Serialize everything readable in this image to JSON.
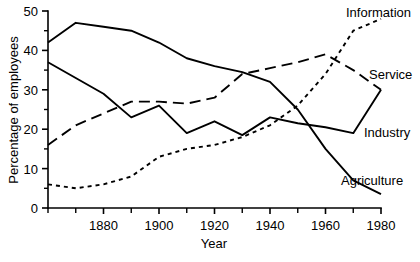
{
  "chart_data": {
    "type": "line",
    "title": "",
    "xlabel": "Year",
    "ylabel": "Percentage of employees",
    "xlim": [
      1860,
      1980
    ],
    "ylim": [
      0,
      50
    ],
    "grid": false,
    "legend_position": "inline-right-of-line-ends",
    "x_ticks": [
      1880,
      1900,
      1920,
      1940,
      1960,
      1980
    ],
    "x_tick_labels": [
      "1880",
      "1900",
      "1920",
      "1940",
      "1960",
      "1980"
    ],
    "x_minor_ticks": [
      1860,
      1870,
      1890,
      1910,
      1930,
      1950,
      1970
    ],
    "y_ticks": [
      0,
      10,
      20,
      30,
      40,
      50
    ],
    "y_tick_labels": [
      "0",
      "10",
      "20",
      "30",
      "40",
      "50"
    ],
    "y_minor_ticks": [
      5,
      15,
      25,
      35,
      45
    ],
    "x": [
      1860,
      1870,
      1880,
      1890,
      1900,
      1910,
      1920,
      1930,
      1940,
      1950,
      1960,
      1970,
      1980
    ],
    "series": [
      {
        "name": "Agriculture",
        "label": "Agriculture",
        "dash": "solid",
        "values": [
          42,
          47,
          46,
          45,
          42,
          38,
          36,
          34.5,
          32,
          25,
          15,
          7,
          3.5
        ]
      },
      {
        "name": "Industry",
        "label": "Industry",
        "dash": "solid",
        "values": [
          37,
          33,
          29,
          23,
          26,
          19,
          22,
          18.5,
          23,
          21.5,
          20.5,
          19,
          30
        ]
      },
      {
        "name": "Service",
        "label": "Service",
        "dash": "dashed",
        "values": [
          16,
          21,
          24,
          27,
          27,
          26.5,
          28,
          34,
          35.5,
          37,
          39,
          35,
          30
        ]
      },
      {
        "name": "Information",
        "label": "Information",
        "dash": "dotted",
        "values": [
          6,
          5,
          6,
          8,
          13,
          15,
          16,
          18,
          21,
          26,
          34,
          45,
          48
        ]
      }
    ],
    "series_labels": [
      {
        "text": "Information",
        "x_px": 346,
        "y_px": 17
      },
      {
        "text": "Service",
        "x_px": 369,
        "y_px": 79
      },
      {
        "text": "Industry",
        "x_px": 364,
        "y_px": 137
      },
      {
        "text": "Agriculture",
        "x_px": 341,
        "y_px": 185
      }
    ]
  }
}
